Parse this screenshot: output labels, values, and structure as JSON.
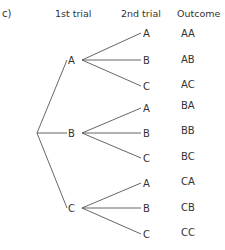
{
  "part_label": "c)",
  "headers": {
    "first": "1st trial",
    "second": "2nd trial",
    "outcome": "Outcome"
  },
  "root": {
    "x": 37,
    "y": 133
  },
  "first_trial": [
    {
      "label": "A",
      "y": 60
    },
    {
      "label": "B",
      "y": 133
    },
    {
      "label": "C",
      "y": 208
    }
  ],
  "second_trial": [
    {
      "label": "A",
      "y": 33,
      "outcome": "AA",
      "oy": 33
    },
    {
      "label": "B",
      "y": 60,
      "outcome": "AB",
      "oy": 59
    },
    {
      "label": "C",
      "y": 86,
      "outcome": "AC",
      "oy": 84
    },
    {
      "label": "A",
      "y": 108,
      "outcome": "BA",
      "oy": 105
    },
    {
      "label": "B",
      "y": 133,
      "outcome": "BB",
      "oy": 130
    },
    {
      "label": "C",
      "y": 158,
      "outcome": "BC",
      "oy": 156
    },
    {
      "label": "A",
      "y": 183,
      "outcome": "CA",
      "oy": 181
    },
    {
      "label": "B",
      "y": 208,
      "outcome": "CB",
      "oy": 207
    },
    {
      "label": "C",
      "y": 234,
      "outcome": "CC",
      "oy": 232
    }
  ],
  "line_color": "#555555"
}
